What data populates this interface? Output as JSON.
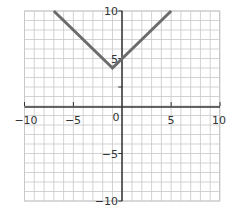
{
  "chart_data": {
    "type": "line",
    "title": "",
    "xlabel": "",
    "ylabel": "",
    "xlim": [
      -10,
      10
    ],
    "ylim": [
      -10,
      10
    ],
    "grid": true,
    "grid_step": 1,
    "x_ticks": [
      "−10",
      "−5",
      "0",
      "5",
      "10"
    ],
    "y_ticks": [
      "10",
      "5",
      "−5",
      "−10"
    ],
    "series": [
      {
        "name": "y = |x + 1| + 4",
        "x": [
          -7,
          -1,
          5
        ],
        "y": [
          10,
          4,
          10
        ],
        "color": "#6b6b6b"
      }
    ]
  },
  "labels": {
    "x_neg10": "−10",
    "x_neg5": "−5",
    "origin": "0",
    "x_5": "5",
    "x_10": "10",
    "y_10": "10",
    "y_5": "5",
    "y_neg5": "−5",
    "y_neg10": "−10"
  },
  "colors": {
    "grid": "#c8c8c8",
    "axis": "#333333",
    "line": "#6b6b6b"
  }
}
